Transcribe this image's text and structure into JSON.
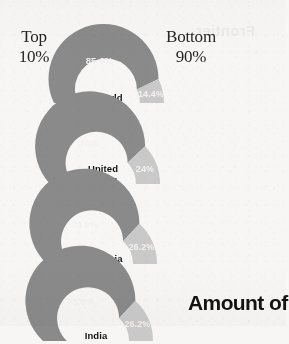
{
  "page": {
    "background_color": "#f7f6f4",
    "ghost_text": "Frontier"
  },
  "legend": {
    "left_label": "Top\n10%",
    "left_line1": "Top",
    "left_line2": "10%",
    "right_line1": "Bottom",
    "right_line2": "90%"
  },
  "headline": {
    "text": "Amount of"
  },
  "colors": {
    "top_share": "#8a8a8a",
    "bottom_share": "#c9c9c9",
    "page": "#f7f6f4",
    "label_light": "#f2f1ef",
    "label_dark": "#141414"
  },
  "chart_data": {
    "type": "pie",
    "title": "Amount of",
    "subtitle": "",
    "xlabel": "",
    "ylabel": "",
    "legend_position": "top",
    "grid": false,
    "series": [
      {
        "name": "Top 10%",
        "color": "#8a8a8a",
        "values": [
          85.6,
          76,
          73.8,
          73.8
        ]
      },
      {
        "name": "Bottom 90%",
        "color": "#c9c9c9",
        "values": [
          14.4,
          24,
          26.2,
          26.2
        ]
      }
    ],
    "categories": [
      "World",
      "United States",
      "Indonesia",
      "India"
    ],
    "units": "%",
    "gauges": [
      {
        "name": "World",
        "label_lines": [
          "World"
        ],
        "top_value": "85.6%",
        "bottom_value": "14.4%",
        "top_number": 85.6,
        "bottom_number": 14.4
      },
      {
        "name": "United States",
        "label_lines": [
          "United",
          "States"
        ],
        "top_value": "76%",
        "bottom_value": "24%",
        "top_number": 76,
        "bottom_number": 24
      },
      {
        "name": "Indonesia",
        "label_lines": [
          "Indonesia"
        ],
        "top_value": "73.8%",
        "bottom_value": "26.2%",
        "top_number": 73.8,
        "bottom_number": 26.2
      },
      {
        "name": "India",
        "label_lines": [
          "India"
        ],
        "top_value": "73.8%",
        "bottom_value": "26.2%",
        "top_number": 73.8,
        "bottom_number": 26.2
      }
    ]
  }
}
